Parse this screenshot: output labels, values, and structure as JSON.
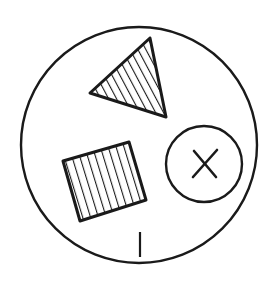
{
  "diagram": {
    "type": "line-drawing",
    "background": "#ffffff",
    "stroke": "#1a1a1a",
    "elements": [
      {
        "name": "outer-circle",
        "shape": "circle",
        "center": [
          139,
          145
        ],
        "radius": 118
      },
      {
        "name": "triangle",
        "shape": "triangle",
        "fill": "hatched",
        "points": [
          [
            150,
            38
          ],
          [
            90,
            93
          ],
          [
            166,
            117
          ]
        ]
      },
      {
        "name": "square",
        "shape": "rotated-square",
        "fill": "hatched",
        "points": [
          [
            63,
            161
          ],
          [
            129,
            142
          ],
          [
            146,
            200
          ],
          [
            80,
            221
          ]
        ]
      },
      {
        "name": "small-circle",
        "shape": "circle",
        "center": [
          204,
          164
        ],
        "radius": 38,
        "mark": "x"
      },
      {
        "name": "tick-mark",
        "shape": "line",
        "from": [
          140,
          232
        ],
        "to": [
          140,
          257
        ]
      }
    ]
  }
}
